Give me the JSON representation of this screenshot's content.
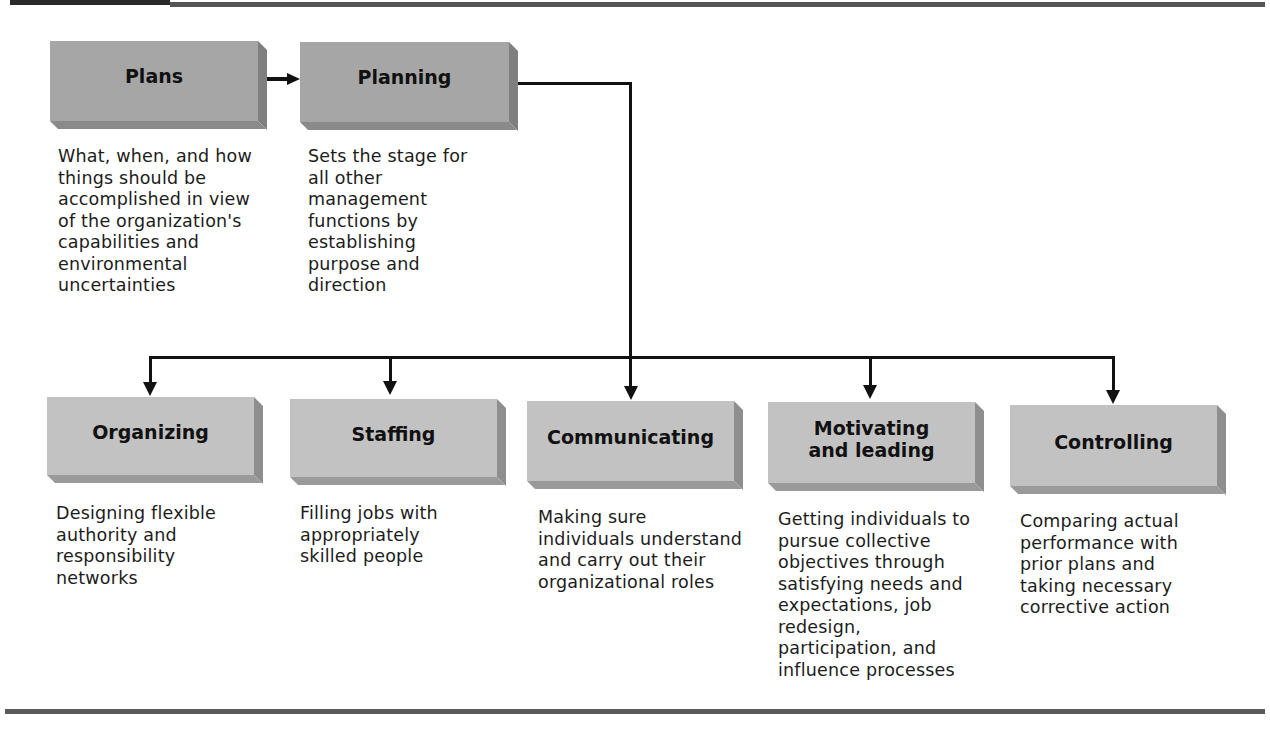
{
  "diagram": {
    "top_nodes": [
      {
        "id": "plans",
        "label": "Plans",
        "description": "What, when, and how things should be accomplished in view of the organization's capabilities and environmental uncertainties"
      },
      {
        "id": "planning",
        "label": "Planning",
        "description": "Sets the stage for all other management functions by establishing purpose and direction"
      }
    ],
    "functions": [
      {
        "id": "organizing",
        "label": "Organizing",
        "description": "Designing flexible authority and responsibility networks"
      },
      {
        "id": "staffing",
        "label": "Staffing",
        "description": "Filling jobs with appropriately skilled people"
      },
      {
        "id": "communicating",
        "label": "Communicating",
        "description": "Making sure individuals understand and carry out their organizational roles"
      },
      {
        "id": "motivating-leading",
        "label": "Motivating and leading",
        "description": "Getting individuals to pursue collective objectives through satisfying needs and expectations, job redesign, participation, and influence processes"
      },
      {
        "id": "controlling",
        "label": "Controlling",
        "description": "Comparing actual performance with prior plans and taking necessary corrective action"
      }
    ],
    "edges": [
      {
        "from": "plans",
        "to": "planning"
      },
      {
        "from": "planning",
        "to": "organizing"
      },
      {
        "from": "planning",
        "to": "staffing"
      },
      {
        "from": "planning",
        "to": "communicating"
      },
      {
        "from": "planning",
        "to": "motivating-leading"
      },
      {
        "from": "planning",
        "to": "controlling"
      }
    ],
    "colors": {
      "top_box": "#a6a6a6",
      "bottom_box": "#c2c2c2",
      "connector": "#111111",
      "rule": "#555555"
    }
  }
}
